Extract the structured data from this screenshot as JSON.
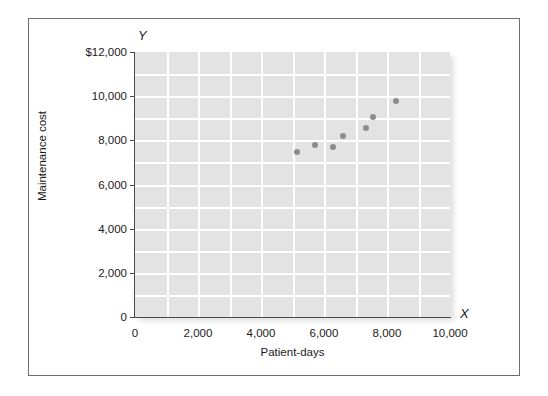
{
  "figure": {
    "background_color": "#ffffff",
    "frame_color": "#6e6e6e",
    "plot_background_color": "#e3e3e3",
    "gridline_color": "#ffffff",
    "point_color": "#8c8c8c",
    "axis_color": "#4a4a4a"
  },
  "axis_symbols": {
    "y": "Y",
    "x": "X"
  },
  "chart_data": {
    "type": "scatter",
    "title": "",
    "xlabel": "Patient-days",
    "ylabel": "Maintenance cost",
    "xlim": [
      0,
      10000
    ],
    "ylim": [
      0,
      12000
    ],
    "grid": true,
    "legend": "none",
    "x_ticks": [
      0,
      2000,
      4000,
      6000,
      8000,
      10000
    ],
    "x_tick_labels": [
      "0",
      "2,000",
      "4,000",
      "6,000",
      "8,000",
      "10,000"
    ],
    "y_ticks": [
      0,
      2000,
      4000,
      6000,
      8000,
      10000,
      12000
    ],
    "y_tick_labels": [
      "0",
      "2,000",
      "4,000",
      "6,000",
      "8,000",
      "10,000",
      "$12,000"
    ],
    "x_minor_gridline_step": 1000,
    "y_minor_gridline_step": 1000,
    "points": [
      {
        "x": 5150,
        "y": 7470
      },
      {
        "x": 5700,
        "y": 7790
      },
      {
        "x": 6300,
        "y": 7700
      },
      {
        "x": 6600,
        "y": 8200
      },
      {
        "x": 7330,
        "y": 8560
      },
      {
        "x": 7550,
        "y": 9060
      },
      {
        "x": 8300,
        "y": 9780
      }
    ]
  }
}
